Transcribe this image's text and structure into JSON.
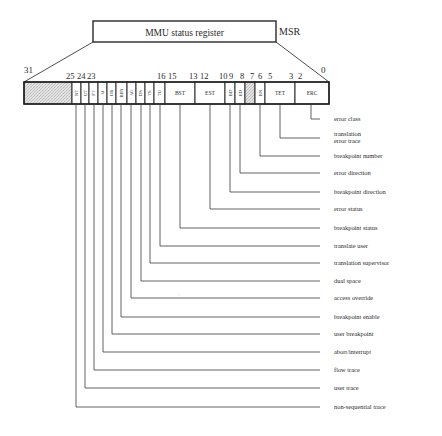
{
  "register": {
    "title": "MMU status register",
    "abbrev": "MSR",
    "msb_label": "31",
    "lsb_label": "0",
    "bit_numbers": [
      {
        "text": "25",
        "x": 66
      },
      {
        "text": "24",
        "x": 77
      },
      {
        "text": "23",
        "x": 87
      },
      {
        "text": "16",
        "x": 157
      },
      {
        "text": "15",
        "x": 168
      },
      {
        "text": "13",
        "x": 189
      },
      {
        "text": "12",
        "x": 200
      },
      {
        "text": "10",
        "x": 219
      },
      {
        "text": "9",
        "x": 229
      },
      {
        "text": "8",
        "x": 240
      },
      {
        "text": "7",
        "x": 250
      },
      {
        "text": "6",
        "x": 258
      },
      {
        "text": "5",
        "x": 268
      },
      {
        "text": "3",
        "x": 289
      },
      {
        "text": "2",
        "x": 298
      }
    ],
    "fields": [
      {
        "abbr": "",
        "x0": 24,
        "x1": 72,
        "shaded": true
      },
      {
        "abbr": "NT",
        "x0": 72,
        "x1": 81,
        "rotated": true,
        "desc": "non-sequential trace"
      },
      {
        "abbr": "UT",
        "x0": 81,
        "x1": 89,
        "rotated": true,
        "desc": "user trace"
      },
      {
        "abbr": "FT",
        "x0": 89,
        "x1": 98,
        "rotated": true,
        "desc": "flow trace"
      },
      {
        "abbr": "AI",
        "x0": 98,
        "x1": 107,
        "rotated": true,
        "desc": "abort/interrupt"
      },
      {
        "abbr": "UB",
        "x0": 107,
        "x1": 116,
        "rotated": true,
        "desc": "user breakpoint"
      },
      {
        "abbr": "BEN",
        "x0": 116,
        "x1": 127,
        "rotated": true,
        "desc": "breakpoint enable"
      },
      {
        "abbr": "AO",
        "x0": 127,
        "x1": 136,
        "rotated": true,
        "desc": "access override"
      },
      {
        "abbr": "DS",
        "x0": 136,
        "x1": 145,
        "rotated": true,
        "desc": "dual space"
      },
      {
        "abbr": "TS",
        "x0": 145,
        "x1": 154,
        "rotated": true,
        "desc": "translation supervisor"
      },
      {
        "abbr": "TU",
        "x0": 154,
        "x1": 165,
        "rotated": true,
        "desc": "translate user"
      },
      {
        "abbr": "BST",
        "x0": 165,
        "x1": 195,
        "rotated": false,
        "desc": "breakpoint status"
      },
      {
        "abbr": "EST",
        "x0": 195,
        "x1": 225,
        "rotated": false,
        "desc": "error status"
      },
      {
        "abbr": "BD",
        "x0": 225,
        "x1": 235,
        "rotated": true,
        "desc": "breakpoint direction"
      },
      {
        "abbr": "ED",
        "x0": 235,
        "x1": 245,
        "rotated": true,
        "desc": "error direction"
      },
      {
        "abbr": "",
        "x0": 245,
        "x1": 255,
        "shaded": true
      },
      {
        "abbr": "BN",
        "x0": 255,
        "x1": 265,
        "rotated": true,
        "desc": "breakpoint number"
      },
      {
        "abbr": "TET",
        "x0": 265,
        "x1": 295,
        "rotated": false,
        "desc": "translation error trace"
      },
      {
        "abbr": "ERC",
        "x0": 295,
        "x1": 329,
        "rotated": false,
        "desc": "error class"
      }
    ]
  },
  "legend": [
    {
      "text": "error class",
      "lineX": 311,
      "y": 119
    },
    {
      "text": "translation",
      "text2": "error trace",
      "lineX": 280,
      "y": 138
    },
    {
      "text": "breakpoint number",
      "lineX": 260,
      "y": 156
    },
    {
      "text": "error direction",
      "lineX": 240,
      "y": 173
    },
    {
      "text": "breakpoint direction",
      "lineX": 230,
      "y": 192
    },
    {
      "text": "error status",
      "lineX": 210,
      "y": 209
    },
    {
      "text": "breakpoint status",
      "lineX": 180,
      "y": 228
    },
    {
      "text": "translate user",
      "lineX": 160,
      "y": 246
    },
    {
      "text": "translation supervisor",
      "lineX": 150,
      "y": 263
    },
    {
      "text": "dual space",
      "lineX": 141,
      "y": 281
    },
    {
      "text": "access override",
      "lineX": 131,
      "y": 298
    },
    {
      "text": "breakpoint enable",
      "lineX": 121,
      "y": 317
    },
    {
      "text": "user breakpoint",
      "lineX": 112,
      "y": 334
    },
    {
      "text": "abort/interrupt",
      "lineX": 103,
      "y": 352
    },
    {
      "text": "flow trace",
      "lineX": 94,
      "y": 370
    },
    {
      "text": "user trace",
      "lineX": 85,
      "y": 388
    },
    {
      "text": "non-sequential trace",
      "lineX": 76,
      "y": 407
    }
  ],
  "colors": {
    "line": "#3a3a3a",
    "shade": "#d6d6d6",
    "text": "#2a2a2a"
  }
}
